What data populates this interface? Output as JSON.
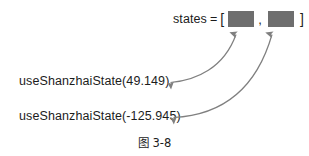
{
  "figure": {
    "caption": "图 3-8",
    "background_color": "#ffffff",
    "text_color": "#1c1c1c",
    "box_fill_color": "#6e6e6e",
    "arrow_color": "#808080"
  },
  "states_expression": {
    "variable": "states",
    "equals": "=",
    "open_bracket": "[",
    "separator": ",",
    "close_bracket": "]",
    "slots": [
      {
        "index": 0,
        "label": "state-slot-1",
        "value": ""
      },
      {
        "index": 1,
        "label": "state-slot-2",
        "value": ""
      }
    ]
  },
  "hook_calls": [
    {
      "text": "useShanzhaiState(49.149)",
      "value": "49.149",
      "target_slot": 0
    },
    {
      "text": "useShanzhaiState(-125.945)",
      "value": "-125.945",
      "target_slot": 1
    }
  ],
  "arrows": [
    {
      "name": "arrow-slot-1",
      "from": "useShanzhaiState(49.149)",
      "to": "state-slot-1"
    },
    {
      "name": "arrow-slot-2",
      "from": "useShanzhaiState(-125.945)",
      "to": "state-slot-2"
    }
  ]
}
